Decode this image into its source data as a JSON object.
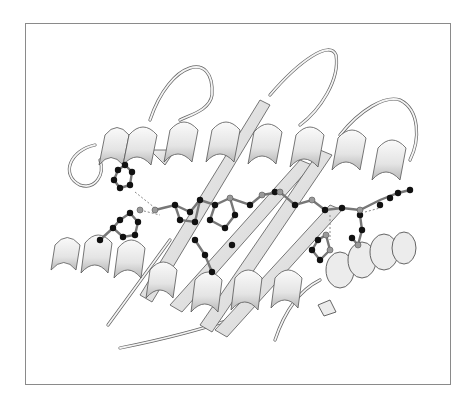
{
  "figure": {
    "type": "protein-ribbon-structure",
    "background": "#ffffff",
    "frame_color": "#8a8a8a",
    "ribbon_color": "#e8e8e8",
    "ribbon_outline": "#555555",
    "atom_dark": "#111111",
    "atom_gray": "#9a9a9a",
    "elements": {
      "helices": 4,
      "beta_strands": 5,
      "ligand_chain": "ball-and-stick"
    }
  }
}
